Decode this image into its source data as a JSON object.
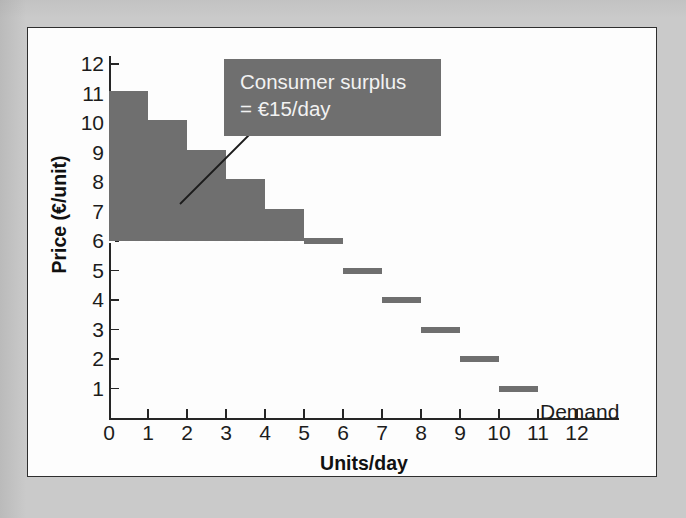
{
  "chart_data": {
    "type": "bar",
    "title": "",
    "xlabel": "Units/day",
    "ylabel": "Price (€/unit)",
    "xlim": [
      0,
      12
    ],
    "ylim": [
      0,
      12
    ],
    "grid": false,
    "x_ticks": [
      "0",
      "1",
      "2",
      "3",
      "4",
      "5",
      "6",
      "7",
      "8",
      "9",
      "10",
      "11",
      "12"
    ],
    "y_ticks": [
      "12",
      "11",
      "10",
      "9",
      "8",
      "7",
      "6",
      "5",
      "4",
      "3",
      "2",
      "1"
    ],
    "series": [
      {
        "name": "Demand",
        "note": "stepped demand schedule; each step spans one unit on the x-axis",
        "steps": [
          {
            "unit_start": 0,
            "unit_end": 1,
            "price": 11
          },
          {
            "unit_start": 1,
            "unit_end": 2,
            "price": 10
          },
          {
            "unit_start": 2,
            "unit_end": 3,
            "price": 9
          },
          {
            "unit_start": 3,
            "unit_end": 4,
            "price": 8
          },
          {
            "unit_start": 4,
            "unit_end": 5,
            "price": 7
          },
          {
            "unit_start": 5,
            "unit_end": 6,
            "price": 6
          },
          {
            "unit_start": 6,
            "unit_end": 7,
            "price": 5
          },
          {
            "unit_start": 7,
            "unit_end": 8,
            "price": 4
          },
          {
            "unit_start": 8,
            "unit_end": 9,
            "price": 3
          },
          {
            "unit_start": 9,
            "unit_end": 10,
            "price": 2
          },
          {
            "unit_start": 10,
            "unit_end": 11,
            "price": 1
          }
        ]
      }
    ],
    "market_price": 6,
    "shaded_region": {
      "label": "Consumer surplus",
      "value_text": "= €15/day",
      "amount": 15,
      "currency": "€",
      "per": "day",
      "units_covered": [
        1,
        2,
        3,
        4,
        5
      ],
      "color": "#6f6f6f"
    },
    "colors": {
      "series": "#6f6f6f",
      "annotation_fill": "#6f6f6f",
      "annotation_text": "#f2f2f2",
      "axis": "#262626",
      "plot_background": "#fdfdfd",
      "page_background": "#cacaca",
      "price_line": "#ffffff"
    }
  },
  "annotation": {
    "line1": "Consumer surplus",
    "line2": "= €15/day"
  },
  "legend": {
    "demand_label": "Demand"
  },
  "axes": {
    "y_title": "Price (€/unit)",
    "x_title": "Units/day"
  }
}
